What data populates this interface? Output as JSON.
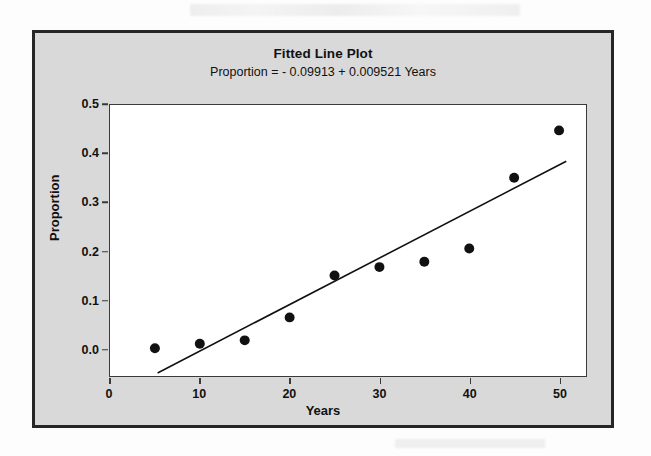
{
  "chart_data": {
    "type": "scatter",
    "title": "Fitted Line Plot",
    "subtitle": "Proportion =  - 0.09913 + 0.009521 Years",
    "xlabel": "Years",
    "ylabel": "Proportion",
    "xlim": [
      0,
      53
    ],
    "ylim": [
      -0.055,
      0.5
    ],
    "grid": false,
    "legend": null,
    "x": [
      5,
      10,
      15,
      20,
      25,
      30,
      35,
      40,
      45,
      50
    ],
    "values": [
      0.002,
      0.011,
      0.018,
      0.065,
      0.151,
      0.168,
      0.179,
      0.206,
      0.351,
      0.448
    ],
    "series": [
      {
        "name": "Proportion",
        "type": "scatter",
        "marker": "filled-circle",
        "color": "#111111",
        "x": [
          5,
          10,
          15,
          20,
          25,
          30,
          35,
          40,
          45,
          50
        ],
        "y": [
          0.002,
          0.011,
          0.018,
          0.065,
          0.151,
          0.168,
          0.179,
          0.206,
          0.351,
          0.448
        ]
      },
      {
        "name": "Fitted line",
        "type": "line",
        "color": "#111111",
        "intercept": -0.09913,
        "slope": 0.009521,
        "x": [
          5.3,
          50.8
        ],
        "y": [
          -0.0487,
          0.3847
        ]
      }
    ],
    "xticks": [
      "0",
      "10",
      "20",
      "30",
      "40",
      "50"
    ],
    "xtick_values": [
      0,
      10,
      20,
      30,
      40,
      50
    ],
    "yticks": [
      "0.0",
      "0.1",
      "0.2",
      "0.3",
      "0.4",
      "0.5"
    ],
    "ytick_values": [
      0.0,
      0.1,
      0.2,
      0.3,
      0.4,
      0.5
    ]
  },
  "style": {
    "panel_background": "#d9d9d9",
    "plot_background": "#ffffff",
    "frame_color": "#262626",
    "axis_color": "#3a3a3a",
    "text_color": "#111111",
    "marker_color": "#111111",
    "line_color": "#111111"
  }
}
